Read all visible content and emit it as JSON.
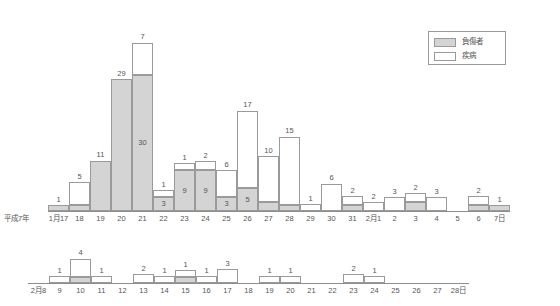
{
  "legend": {
    "items": [
      {
        "label": "負傷者",
        "fill": "#d4d4d4",
        "key": "injured"
      },
      {
        "label": "疾病",
        "fill": "#ffffff",
        "key": "illness"
      }
    ]
  },
  "axis": {
    "row1_start_label": "平成7年",
    "row2_start_label": "2月8"
  },
  "chart_data": {
    "type": "bar",
    "title": "",
    "subtitle": "",
    "xlabel": "",
    "ylabel": "",
    "stacked": true,
    "grid": false,
    "legend_position": "top-right",
    "series": [
      {
        "name": "負傷者",
        "key": "injured",
        "color": "#d4d4d4"
      },
      {
        "name": "疾病",
        "key": "illness",
        "color": "#ffffff"
      }
    ],
    "rows": [
      {
        "row": 1,
        "start_label": "平成7年",
        "categories": [
          "1月17",
          "18",
          "19",
          "20",
          "21",
          "22",
          "23",
          "24",
          "25",
          "26",
          "27",
          "28",
          "29",
          "30",
          "31",
          "2月1",
          "2",
          "3",
          "4",
          "5",
          "6",
          "7日"
        ],
        "injured": [
          1,
          1,
          11,
          29,
          30,
          3,
          9,
          9,
          3,
          5,
          2,
          1,
          0,
          0,
          1,
          0,
          0,
          2,
          0,
          0,
          1,
          1
        ],
        "illness": [
          0,
          5,
          0,
          0,
          7,
          1,
          1,
          2,
          6,
          17,
          10,
          15,
          1,
          6,
          2,
          2,
          3,
          2,
          3,
          0,
          2,
          0
        ]
      },
      {
        "row": 2,
        "start_label": "2月8",
        "categories": [
          "2月8",
          "9",
          "10",
          "11",
          "12",
          "13",
          "14",
          "15",
          "16",
          "17",
          "18",
          "19",
          "20",
          "21",
          "22",
          "23",
          "24",
          "25",
          "26",
          "27",
          "28日"
        ],
        "injured": [
          0,
          0,
          1,
          0,
          0,
          0,
          0,
          1,
          0,
          0,
          0,
          0,
          0,
          0,
          0,
          0,
          0,
          0,
          0,
          0,
          0
        ],
        "illness": [
          0,
          1,
          4,
          1,
          0,
          2,
          1,
          1,
          1,
          3,
          0,
          1,
          1,
          0,
          0,
          2,
          1,
          0,
          0,
          0,
          0
        ]
      }
    ],
    "value_labels_row1_top": [
      "1",
      "5",
      "11",
      "29",
      "7",
      "1",
      "1",
      "2",
      "6",
      "17",
      "10",
      "15",
      "1",
      "6",
      "2",
      "2",
      "3",
      "2",
      "3",
      "",
      "2",
      "1"
    ],
    "value_labels_row1_inner_gray": [
      "1",
      "1",
      "11",
      "29",
      "30",
      "3",
      "9",
      "9",
      "3",
      "5",
      "2",
      "1",
      "",
      "",
      "1",
      "",
      "",
      "2",
      "",
      "",
      "1",
      "1"
    ],
    "value_labels_row2_top": [
      "",
      "1",
      "4",
      "1",
      "",
      "2",
      "1",
      "1",
      "1",
      "3",
      "",
      "1",
      "1",
      "",
      "",
      "2",
      "1",
      "",
      "",
      "",
      ""
    ],
    "value_labels_row2_inner_gray": [
      "",
      "",
      "1",
      "",
      "",
      "",
      "",
      "1",
      "",
      "",
      "",
      "",
      "",
      "",
      "",
      "",
      "",
      "",
      "",
      "",
      ""
    ]
  }
}
